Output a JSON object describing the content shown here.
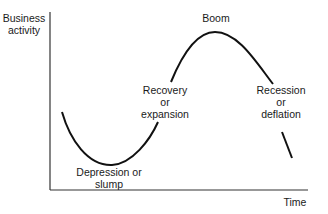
{
  "diagram": {
    "y_axis_label": [
      "Business",
      "activity"
    ],
    "x_axis_label": "Time",
    "phases": {
      "depression": [
        "Depression or",
        "slump"
      ],
      "recovery": [
        "Recovery",
        "or",
        "expansion"
      ],
      "boom": "Boom",
      "recession": [
        "Recession",
        "or",
        "deflation"
      ]
    },
    "colors": {
      "line": "#111111",
      "axis": "#333333",
      "text": "#1a1a1a"
    }
  }
}
